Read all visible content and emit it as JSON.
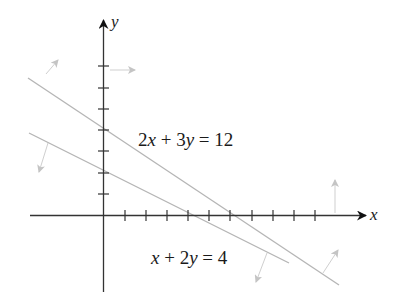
{
  "diagram": {
    "type": "linear-inequalities-graph",
    "axes": {
      "x_label": "x",
      "y_label": "y",
      "x_ticks": [
        1,
        2,
        3,
        4,
        5,
        6,
        7,
        8,
        9,
        10
      ],
      "y_ticks": [
        1,
        2,
        3,
        4,
        5,
        6,
        7
      ],
      "axis_color": "#333333"
    },
    "lines": [
      {
        "id": "line-1",
        "equation": "2x + 3y = 12",
        "label_parts": [
          "2",
          "x",
          " + 3",
          "y",
          " = 12"
        ],
        "x_intercept": 6,
        "y_intercept": 4,
        "color": "#b5b5b5"
      },
      {
        "id": "line-2",
        "equation": "x + 2y = 4",
        "label_parts": [
          "x",
          " + 2",
          "y",
          " = 4"
        ],
        "x_intercept": 4,
        "y_intercept": 2,
        "color": "#b5b5b5"
      }
    ],
    "arrows": [
      {
        "id": "arrow-line1-upper-left",
        "direction": "away-from-origin"
      },
      {
        "id": "arrow-yaxis-right",
        "direction": "right"
      },
      {
        "id": "arrow-line2-lower-left",
        "direction": "toward-origin"
      },
      {
        "id": "arrow-xaxis-up",
        "direction": "up"
      },
      {
        "id": "arrow-line2-lower-right",
        "direction": "toward-origin"
      },
      {
        "id": "arrow-line1-lower-right",
        "direction": "away-from-origin"
      }
    ],
    "arrow_color": "#c8c8c8"
  }
}
